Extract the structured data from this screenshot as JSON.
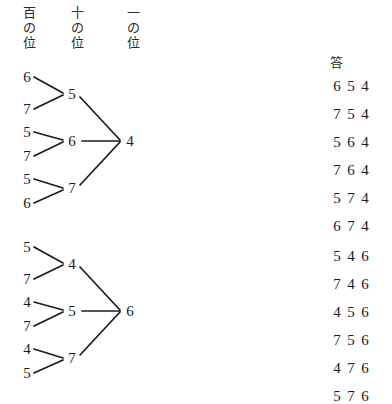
{
  "page": {
    "background_color": "#ffffff",
    "ink_color": "#1b1b1b"
  },
  "column_headers": [
    {
      "name": "hundreds-place",
      "chars": [
        "百",
        "の",
        "位"
      ],
      "x": 20
    },
    {
      "name": "tens-place",
      "chars": [
        "十",
        "の",
        "位"
      ],
      "x": 68
    },
    {
      "name": "ones-place",
      "chars": [
        "一",
        "の",
        "位"
      ],
      "x": 124
    }
  ],
  "answers": {
    "header": "答",
    "groups": [
      {
        "rows": [
          [
            "6",
            "5",
            "4"
          ],
          [
            "7",
            "5",
            "4"
          ],
          [
            "5",
            "6",
            "4"
          ],
          [
            "7",
            "6",
            "4"
          ],
          [
            "5",
            "7",
            "4"
          ],
          [
            "6",
            "7",
            "4"
          ]
        ]
      },
      {
        "rows": [
          [
            "5",
            "4",
            "6"
          ],
          [
            "7",
            "4",
            "6"
          ],
          [
            "4",
            "5",
            "6"
          ],
          [
            "7",
            "5",
            "6"
          ],
          [
            "4",
            "7",
            "6"
          ],
          [
            "5",
            "7",
            "6"
          ]
        ]
      }
    ]
  },
  "trees": [
    {
      "id": "tree-1",
      "ones_digit": "4",
      "branches": [
        {
          "tens": "5",
          "hundreds": [
            "6",
            "7"
          ]
        },
        {
          "tens": "6",
          "hundreds": [
            "5",
            "7"
          ]
        },
        {
          "tens": "7",
          "hundreds": [
            "5",
            "6"
          ]
        }
      ]
    },
    {
      "id": "tree-2",
      "ones_digit": "6",
      "branches": [
        {
          "tens": "4",
          "hundreds": [
            "5",
            "7"
          ]
        },
        {
          "tens": "5",
          "hundreds": [
            "4",
            "7"
          ]
        },
        {
          "tens": "7",
          "hundreds": [
            "4",
            "5"
          ]
        }
      ]
    }
  ]
}
